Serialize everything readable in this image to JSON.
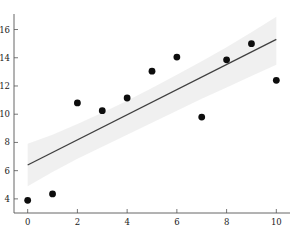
{
  "figure": {
    "background_color": "#ffffff",
    "width": 298,
    "height": 248
  },
  "caption": {
    "text": ""
  },
  "chart_data": {
    "type": "scatter",
    "title": "",
    "subtitle": "",
    "xlabel": "",
    "ylabel": "",
    "xlim": [
      -0.55,
      10.55
    ],
    "ylim": [
      3.0,
      17.1
    ],
    "grid": false,
    "legend": null,
    "x_ticks": [
      0,
      2,
      4,
      6,
      8,
      10
    ],
    "x_tick_labels": [
      "0",
      "2",
      "4",
      "6",
      "8",
      "10"
    ],
    "y_ticks": [
      4,
      6,
      8,
      10,
      12,
      14,
      16
    ],
    "y_tick_labels": [
      "4",
      "6",
      "8",
      "10",
      "12",
      "14",
      "16"
    ],
    "point_color": "#0d0d0d",
    "line_color": "#3f3f3f",
    "band_color": "#d8d8d8",
    "x": [
      0,
      1,
      2,
      3,
      4,
      5,
      6,
      7,
      8,
      9,
      10
    ],
    "y": [
      3.9,
      4.35,
      10.8,
      10.25,
      11.15,
      13.05,
      14.05,
      9.8,
      13.85,
      15.0,
      12.4
    ],
    "series": [
      {
        "name": "observations",
        "type": "scatter",
        "x": [
          0,
          1,
          2,
          3,
          4,
          5,
          6,
          7,
          8,
          9,
          10
        ],
        "values": [
          3.9,
          4.35,
          10.8,
          10.25,
          11.15,
          13.05,
          14.05,
          9.8,
          13.85,
          15.0,
          12.4
        ]
      },
      {
        "name": "regression-line",
        "type": "line",
        "x": [
          0,
          10
        ],
        "values": [
          6.4,
          15.3
        ]
      }
    ],
    "confidence_band": {
      "x": [
        0,
        1,
        2,
        3,
        4,
        5,
        6,
        7,
        8,
        9,
        10
      ],
      "upper": [
        7.9,
        8.55,
        9.3,
        10.1,
        10.95,
        11.85,
        12.8,
        13.75,
        14.75,
        15.8,
        16.9
      ],
      "lower": [
        4.9,
        5.9,
        6.85,
        7.7,
        8.55,
        9.4,
        10.25,
        11.1,
        11.9,
        12.7,
        13.5
      ]
    }
  }
}
